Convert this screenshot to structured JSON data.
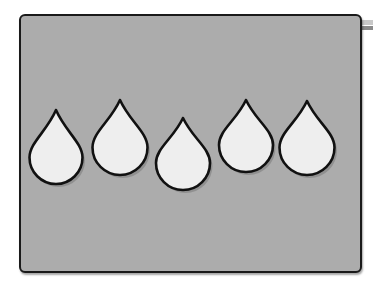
{
  "scene": {
    "description": "Gray rounded panel with five white water drops",
    "panel": {
      "fill": "#acacac",
      "border": "#1a1a1a"
    },
    "drop_style": {
      "fill": "#eeeeee",
      "stroke": "#111111",
      "shadow": "#7a7a7a"
    },
    "drop_count": "5",
    "drops": [
      {
        "id": "drop-1",
        "tip_x": 56,
        "tip_y": 110,
        "width": 53,
        "bottom_y": 184
      },
      {
        "id": "drop-2",
        "tip_x": 120,
        "tip_y": 100,
        "width": 55,
        "bottom_y": 175
      },
      {
        "id": "drop-3",
        "tip_x": 183,
        "tip_y": 118,
        "width": 54,
        "bottom_y": 190
      },
      {
        "id": "drop-4",
        "tip_x": 246,
        "tip_y": 100,
        "width": 54,
        "bottom_y": 172
      },
      {
        "id": "drop-5",
        "tip_x": 307,
        "tip_y": 101,
        "width": 55,
        "bottom_y": 175
      }
    ]
  }
}
